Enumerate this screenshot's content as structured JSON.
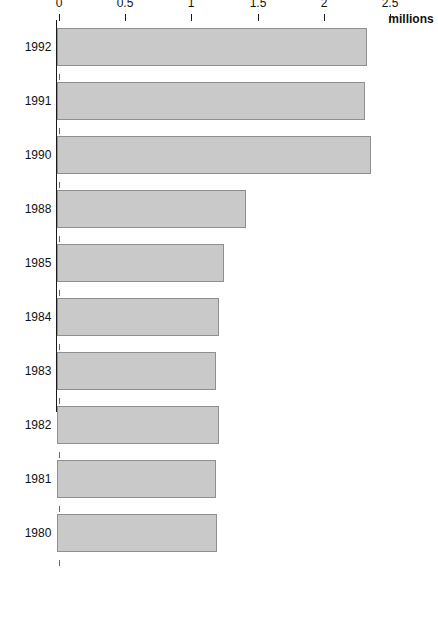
{
  "chart_data": {
    "type": "bar",
    "orientation": "horizontal",
    "title": "",
    "subtitle": "",
    "xlabel": "",
    "ylabel": "millions",
    "axis_unit_label": "millions",
    "categories": [
      "1992",
      "1991",
      "1990",
      "1988",
      "1985",
      "1984",
      "1983",
      "1982",
      "1981",
      "1980"
    ],
    "values": [
      2.34,
      2.33,
      2.37,
      1.43,
      1.26,
      1.22,
      1.2,
      1.22,
      1.2,
      1.21
    ],
    "tick_labels": [
      "2.5",
      "2",
      "1.5",
      "1",
      "0.5",
      "0"
    ],
    "tick_values": [
      2.5,
      2,
      1.5,
      1,
      0.5,
      0
    ],
    "value_axis_range": [
      0,
      2.5
    ],
    "grid": false,
    "legend": null,
    "bar_color": "#c9c9c9",
    "bar_border_color": "#8f8f8f",
    "axis_color": "#1a1a1a",
    "rotation_degrees": 90
  }
}
